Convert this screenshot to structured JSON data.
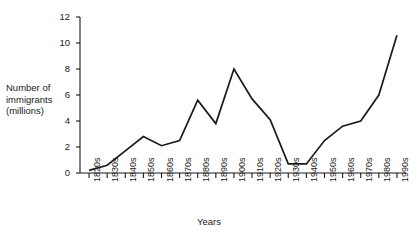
{
  "chart_data": {
    "type": "line",
    "title": "",
    "xlabel": "Years",
    "ylabel_lines": [
      "Number of",
      "immigrants",
      "(millions)"
    ],
    "ylabel": "Number of immigrants (millions)",
    "categories": [
      "1820s",
      "1830s",
      "1840s",
      "1850s",
      "1860s",
      "1870s",
      "1880s",
      "1890s",
      "1900s",
      "1910s",
      "1920s",
      "1930s",
      "1940s",
      "1950s",
      "1960s",
      "1970s",
      "1980s",
      "1990s"
    ],
    "values": [
      0.2,
      0.6,
      1.7,
      2.8,
      2.1,
      2.5,
      5.6,
      3.8,
      8.0,
      5.7,
      4.1,
      0.7,
      0.7,
      2.5,
      3.6,
      4.0,
      6.0,
      10.6
    ],
    "series": [
      {
        "name": "Number of immigrants (millions)",
        "values": [
          0.2,
          0.6,
          1.7,
          2.8,
          2.1,
          2.5,
          5.6,
          3.8,
          8.0,
          5.7,
          4.1,
          0.7,
          0.7,
          2.5,
          3.6,
          4.0,
          6.0,
          10.6
        ]
      }
    ],
    "ylim": [
      0,
      12
    ],
    "yticks": [
      0,
      2,
      4,
      6,
      8,
      10,
      12
    ],
    "ytick_labels": [
      "0",
      "2",
      "4",
      "6",
      "8",
      "10",
      "12"
    ],
    "grid": false,
    "legend": false,
    "legend_position": "none",
    "line_color": "#1a1a1a",
    "axis_color": "#1a1a1a",
    "background_color": "#ffffff"
  }
}
